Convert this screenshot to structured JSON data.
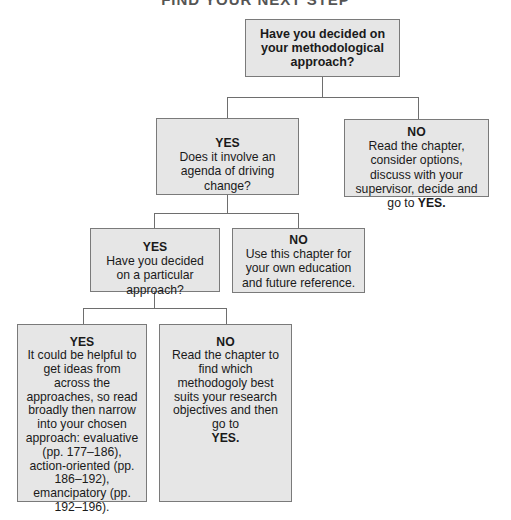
{
  "title": "FIND YOUR NEXT STEP",
  "nodes": {
    "root": {
      "question": "Have you decided on your methodological approach?"
    },
    "yes1": {
      "label": "YES",
      "text": "Does it involve an agenda of driving change?"
    },
    "no1": {
      "label": "NO",
      "text": "Read the chapter, consider options, discuss with your supervisor, decide and go to",
      "emphasis": "YES."
    },
    "yes2": {
      "label": "YES",
      "text": "Have you decided on a particular approach?"
    },
    "no2": {
      "label": "NO",
      "text": "Use this chapter for your own education and future reference."
    },
    "yes3": {
      "label": "YES",
      "text": "It could be helpful to get ideas from across the approaches, so read broadly then narrow into your chosen approach: evaluative (pp. 177–186), action-oriented (pp. 186–192), emancipatory (pp. 192–196)."
    },
    "no3": {
      "label": "NO",
      "text": "Read the chapter to find which methodogoly best suits your research objectives and then go to",
      "emphasis": "YES."
    }
  },
  "colors": {
    "box_fill": "#e6e6e6",
    "box_border": "#7a7a7a",
    "connector": "#6e6e6e"
  }
}
